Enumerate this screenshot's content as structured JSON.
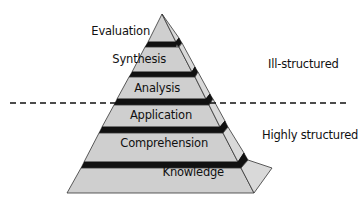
{
  "diagram": {
    "type": "pyramid",
    "colors": {
      "front_face": "#cfcfcf",
      "side_face": "#d9d9d9",
      "band": "#111111",
      "outline": "#333333",
      "dashed_line": "#111111",
      "text": "#111111"
    },
    "levels": [
      {
        "label": "Evaluation",
        "front": "162,14 148,42 176,42",
        "side": "162,14 176,42 179,38",
        "band": "148,42 176,42 179,38 176,47 145,47",
        "band_right": "176,42 179,38 182,43 178,47"
      },
      {
        "label": "Synthesis",
        "front": "145,47 179,47 192,72 132,72",
        "side": "179,47 182,43 195,67 192,72",
        "band": "132,72 192,72 195,67 195,77 129,77",
        "band_right": "192,72 195,67 198,72 195,77"
      },
      {
        "label": "Analysis",
        "front": "129,77 195,77 206,99 117,99",
        "side": "195,77 198,72 210,94 206,99",
        "band": "117,99 206,99 210,94 209,105 114,105",
        "band_right": "206,99 210,94 213,99 209,105"
      },
      {
        "label": "Application",
        "front": "114,105 209,105 220,127 102,127",
        "side": "209,105 213,99 225,121 220,127",
        "band": "102,127 220,127 225,121 223,133 99,133",
        "band_right": "220,127 225,121 228,127 223,133"
      },
      {
        "label": "Comprehension",
        "front": "99,133 223,133 238,162 84,162",
        "side": "223,133 228,127 244,153 238,162",
        "band": "84,162 238,162 244,153 241,168 81,168",
        "band_right": "238,162 244,153 248,160 241,168"
      },
      {
        "label": "Knowledge",
        "front": "81,168 241,168 254,193 67,193",
        "side": "241,168 248,160 272,168 254,193"
      }
    ],
    "label_positions": [
      {
        "right": 210,
        "top": 24
      },
      {
        "right": 226,
        "top": 52
      },
      {
        "right": 240,
        "top": 81
      },
      {
        "right": 252,
        "top": 108
      },
      {
        "right": 268,
        "top": 136
      },
      {
        "right": 284,
        "top": 165
      }
    ],
    "divider": {
      "x1": 10,
      "y1": 103,
      "x2": 350,
      "y2": 103,
      "dash": "6,4"
    },
    "regions": [
      {
        "label": "Ill-structured"
      },
      {
        "label": "Highly structured"
      }
    ]
  }
}
